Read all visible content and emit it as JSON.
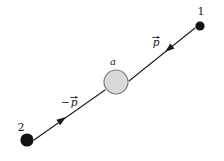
{
  "figure": {
    "kind": "physics-vector-diagram",
    "background_color": "#ffffff",
    "width": 224,
    "height": 161,
    "stroke_color": "#1a1a1a",
    "particle_fill": "#111111",
    "target_fill": "#d9d9d9",
    "target_stroke": "#777777"
  },
  "labels": {
    "particle_1": "1",
    "particle_2": "2",
    "target": "a",
    "momentum_out": "p",
    "momentum_in_sign": "−",
    "momentum_in": "p"
  },
  "nodes": [
    {
      "id": "particle-1",
      "label": "1",
      "x": 200,
      "y": 26,
      "radius": 4.6,
      "fill": "#111111",
      "label_x": 201,
      "label_y": 15
    },
    {
      "id": "particle-2",
      "label": "2",
      "x": 27,
      "y": 140,
      "radius": 6.6,
      "fill": "#111111",
      "label_x": 21,
      "label_y": 131
    },
    {
      "id": "target-a",
      "label": "a",
      "x": 116,
      "y": 82,
      "radius": 12,
      "fill": "#d9d9d9",
      "stroke": "#777777",
      "label_x": 113,
      "label_y": 65
    }
  ],
  "vectors": [
    {
      "id": "momentum-out",
      "label": "p",
      "sign": "",
      "from_x": 129,
      "from_y": 81,
      "to_x": 195,
      "to_y": 28,
      "arrow_x": 163,
      "arrow_y": 53,
      "direction_deg": -38.8,
      "label_x": 156,
      "label_y": 44
    },
    {
      "id": "momentum-in",
      "label": "p",
      "sign": "−",
      "from_x": 105,
      "from_y": 90,
      "to_x": 34,
      "to_y": 140,
      "arrow_x": 68,
      "arrow_y": 116,
      "direction_deg": 144.8,
      "label_x": 72,
      "label_y": 104
    }
  ]
}
